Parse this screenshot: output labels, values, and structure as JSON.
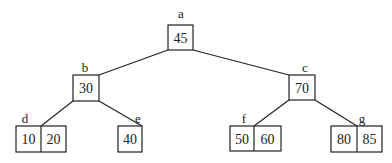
{
  "tree": {
    "nodes": [
      {
        "id": "a",
        "label": "a",
        "keys": [
          "45"
        ]
      },
      {
        "id": "b",
        "label": "b",
        "keys": [
          "30"
        ]
      },
      {
        "id": "c",
        "label": "c",
        "keys": [
          "70"
        ]
      },
      {
        "id": "d",
        "label": "d",
        "keys": [
          "10",
          "20"
        ]
      },
      {
        "id": "e",
        "label": "e",
        "keys": [
          "40"
        ]
      },
      {
        "id": "f",
        "label": "f",
        "keys": [
          "50",
          "60"
        ]
      },
      {
        "id": "g",
        "label": "g",
        "keys": [
          "80",
          "85"
        ]
      }
    ],
    "edges": [
      {
        "from": "a",
        "to": "b"
      },
      {
        "from": "a",
        "to": "c"
      },
      {
        "from": "b",
        "to": "d"
      },
      {
        "from": "b",
        "to": "e"
      },
      {
        "from": "c",
        "to": "f"
      },
      {
        "from": "c",
        "to": "g"
      }
    ]
  }
}
